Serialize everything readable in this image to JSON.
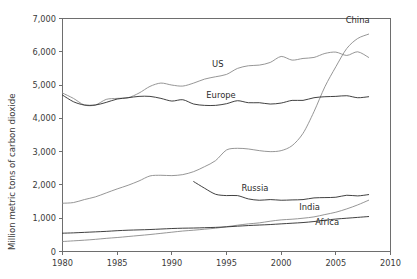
{
  "chart_data": {
    "type": "line",
    "title": "",
    "subtitle": "",
    "xlabel": "",
    "ylabel": "Million metric tons of carbon dioxide",
    "xlim": [
      1980,
      2010
    ],
    "ylim": [
      0,
      7000
    ],
    "grid": false,
    "legend_position": "inline-labels",
    "x_ticks": [
      1980,
      1985,
      1990,
      1995,
      2000,
      2005,
      2010
    ],
    "x_tick_labels": [
      "1980",
      "1985",
      "1990",
      "1995",
      "2000",
      "2005",
      "2010"
    ],
    "y_ticks": [
      0,
      1000,
      2000,
      3000,
      4000,
      5000,
      6000,
      7000
    ],
    "y_tick_labels": [
      "0",
      "1,000",
      "2,000",
      "3,000",
      "4,000",
      "5,000",
      "6,000",
      "7,000"
    ],
    "series": [
      {
        "name": "China",
        "color": "#8a8a8a",
        "label_x": 2007.0,
        "label_y": 6850,
        "x": [
          1980,
          1981,
          1982,
          1983,
          1984,
          1985,
          1986,
          1987,
          1988,
          1989,
          1990,
          1991,
          1992,
          1993,
          1994,
          1995,
          1996,
          1997,
          1998,
          1999,
          2000,
          2001,
          2002,
          2003,
          2004,
          2005,
          2006,
          2007,
          2008
        ],
        "values": [
          1450,
          1470,
          1560,
          1640,
          1760,
          1880,
          1990,
          2120,
          2270,
          2290,
          2280,
          2310,
          2400,
          2550,
          2730,
          3050,
          3100,
          3080,
          3030,
          3000,
          3030,
          3180,
          3550,
          4200,
          4950,
          5550,
          6100,
          6400,
          6530
        ]
      },
      {
        "name": "US",
        "color": "#8a8a8a",
        "label_x": 1994.2,
        "label_y": 5540,
        "x": [
          1980,
          1981,
          1982,
          1983,
          1984,
          1985,
          1986,
          1987,
          1988,
          1989,
          1990,
          1991,
          1992,
          1993,
          1994,
          1995,
          1996,
          1997,
          1998,
          1999,
          2000,
          2001,
          2002,
          2003,
          2004,
          2005,
          2006,
          2007,
          2008
        ],
        "values": [
          4760,
          4600,
          4400,
          4400,
          4570,
          4600,
          4620,
          4760,
          4960,
          5060,
          5000,
          4970,
          5060,
          5180,
          5250,
          5320,
          5500,
          5580,
          5600,
          5680,
          5860,
          5750,
          5800,
          5830,
          5950,
          5990,
          5890,
          6000,
          5830
        ]
      },
      {
        "name": "Europe",
        "color": "#2b2b2b",
        "label_x": 1994.5,
        "label_y": 4620,
        "x": [
          1980,
          1981,
          1982,
          1983,
          1984,
          1985,
          1986,
          1987,
          1988,
          1989,
          1990,
          1991,
          1992,
          1993,
          1994,
          1995,
          1996,
          1997,
          1998,
          1999,
          2000,
          2001,
          2002,
          2003,
          2004,
          2005,
          2006,
          2007,
          2008
        ],
        "values": [
          4700,
          4500,
          4400,
          4400,
          4480,
          4580,
          4620,
          4660,
          4660,
          4600,
          4520,
          4560,
          4430,
          4390,
          4390,
          4440,
          4530,
          4470,
          4470,
          4430,
          4460,
          4540,
          4540,
          4620,
          4650,
          4660,
          4680,
          4620,
          4650
        ]
      },
      {
        "name": "Russia",
        "color": "#2b2b2b",
        "label_x": 1997.6,
        "label_y": 1820,
        "x": [
          1992,
          1993,
          1994,
          1995,
          1996,
          1997,
          1998,
          1999,
          2000,
          2001,
          2002,
          2003,
          2004,
          2005,
          2006,
          2007,
          2008
        ],
        "values": [
          2100,
          1900,
          1720,
          1680,
          1680,
          1580,
          1540,
          1560,
          1540,
          1550,
          1560,
          1610,
          1620,
          1630,
          1690,
          1670,
          1710
        ]
      },
      {
        "name": "India",
        "color": "#8a8a8a",
        "label_x": 2002.6,
        "label_y": 1240,
        "x": [
          1980,
          1981,
          1982,
          1983,
          1984,
          1985,
          1986,
          1987,
          1988,
          1989,
          1990,
          1991,
          1992,
          1993,
          1994,
          1995,
          1996,
          1997,
          1998,
          1999,
          2000,
          2001,
          2002,
          2003,
          2004,
          2005,
          2006,
          2007,
          2008
        ],
        "values": [
          300,
          320,
          340,
          365,
          395,
          420,
          450,
          480,
          510,
          545,
          580,
          615,
          640,
          670,
          700,
          745,
          790,
          830,
          860,
          910,
          950,
          970,
          1000,
          1040,
          1110,
          1180,
          1280,
          1400,
          1540
        ]
      },
      {
        "name": "Africa",
        "color": "#2b2b2b",
        "label_x": 2004.2,
        "label_y": 790,
        "x": [
          1980,
          1981,
          1982,
          1983,
          1984,
          1985,
          1986,
          1987,
          1988,
          1989,
          1990,
          1991,
          1992,
          1993,
          1994,
          1995,
          1996,
          1997,
          1998,
          1999,
          2000,
          2001,
          2002,
          2003,
          2004,
          2005,
          2006,
          2007,
          2008
        ],
        "values": [
          550,
          560,
          575,
          590,
          605,
          625,
          640,
          650,
          660,
          675,
          690,
          700,
          705,
          715,
          725,
          740,
          760,
          780,
          795,
          810,
          830,
          850,
          870,
          900,
          940,
          975,
          1000,
          1025,
          1050
        ]
      }
    ]
  }
}
